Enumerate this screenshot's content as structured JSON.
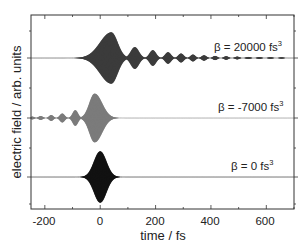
{
  "chart_data": {
    "type": "line",
    "title": "",
    "xlabel": "time / fs",
    "ylabel": "electric field / arb. units",
    "xlim": [
      -250,
      700
    ],
    "x_ticks_major": [
      -200,
      0,
      200,
      400,
      600
    ],
    "x_tick_labels": [
      "-200",
      "0",
      "200",
      "400",
      "600"
    ],
    "x_ticks_minor_step": 100,
    "y_tick_labels": [],
    "grid": false,
    "legend": null,
    "series": [
      {
        "name": "β = 20000 fs³",
        "label_main": "β = 20000 fs",
        "label_sup": "3",
        "dispersion_fs3": 20000,
        "color": "#3a3a3a",
        "baseline_offset": 2,
        "peak_time_fs": 40,
        "peak_amplitude": 1.0,
        "description": "main pulse peaked near +40 fs, followed by decaying trailing sub-pulses at ~120, 190, 245, 290, 330, 375, 415, 455 fs out to ~700 fs",
        "sub_pulse_times_fs": [
          40,
          125,
          190,
          245,
          292,
          335,
          375,
          415,
          455,
          495,
          535,
          575,
          615,
          655
        ],
        "sub_pulse_amplitudes": [
          1.0,
          0.42,
          0.3,
          0.22,
          0.17,
          0.13,
          0.1,
          0.08,
          0.065,
          0.05,
          0.04,
          0.035,
          0.03,
          0.025
        ]
      },
      {
        "name": "β = -7000 fs³",
        "label_main": "β = -7000 fs",
        "label_sup": "3",
        "dispersion_fs3": -7000,
        "color": "#7a7a7a",
        "baseline_offset": 1,
        "peak_time_fs": -20,
        "peak_amplitude": 0.95,
        "description": "main pulse peaked near -20 fs, preceded by decaying leading sub-pulses at ~-90, -135, -175, -215 fs",
        "sub_pulse_times_fs": [
          -20,
          -90,
          -137,
          -177,
          -215,
          -245
        ],
        "sub_pulse_amplitudes": [
          0.95,
          0.3,
          0.17,
          0.11,
          0.07,
          0.05
        ]
      },
      {
        "name": "β = 0 fs³",
        "label_main": "β = 0 fs",
        "label_sup": "3",
        "dispersion_fs3": 0,
        "color": "#111111",
        "baseline_offset": 0,
        "peak_time_fs": 0,
        "peak_amplitude": 1.0,
        "description": "transform-limited pulse centered at 0 fs, envelope FWHM ~50 fs, extends ~-60 to +70 fs",
        "sub_pulse_times_fs": [
          0
        ],
        "sub_pulse_amplitudes": [
          1.0
        ]
      }
    ]
  },
  "axes": {
    "x_label": "time / fs",
    "y_label": "electric field / arb. units",
    "x_ticks": [
      {
        "value": -200,
        "label": "-200"
      },
      {
        "value": 0,
        "label": "0"
      },
      {
        "value": 200,
        "label": "200"
      },
      {
        "value": 400,
        "label": "400"
      },
      {
        "value": 600,
        "label": "600"
      }
    ]
  },
  "annotations": [
    {
      "main": "β = 20000 fs",
      "sup": "3"
    },
    {
      "main": "β = -7000 fs",
      "sup": "3"
    },
    {
      "main": "β = 0 fs",
      "sup": "3"
    }
  ]
}
